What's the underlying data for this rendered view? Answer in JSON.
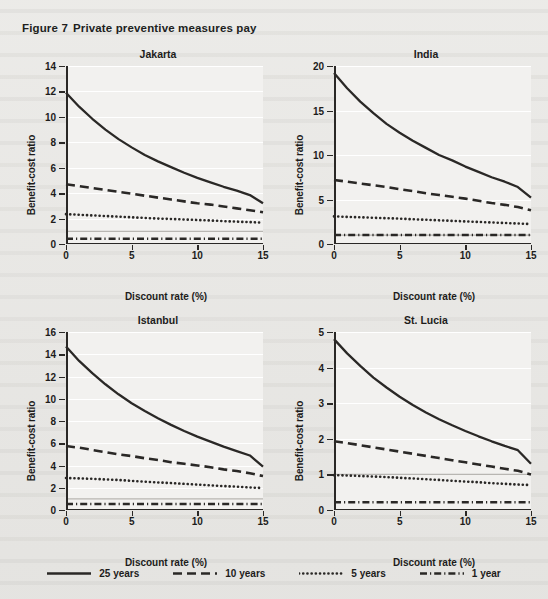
{
  "figure": {
    "number": "Figure 7",
    "title": "Private preventive measures pay"
  },
  "colors": {
    "line": "#2a2826",
    "reference_line": "#b8b6b2",
    "plot_background": "#f2f1ef",
    "page_background": "#e8e7e4",
    "gridline": "#ffffff",
    "text": "#1d1c1b"
  },
  "legend": {
    "position": "bottom-center",
    "items": [
      {
        "label": "25 years",
        "style": "solid",
        "name": "legend-25-years"
      },
      {
        "label": "10 years",
        "style": "dashed",
        "name": "legend-10-years"
      },
      {
        "label": "5 years",
        "style": "dotted",
        "name": "legend-5-years"
      },
      {
        "label": "1 year",
        "style": "dashdotted",
        "name": "legend-1-year"
      }
    ]
  },
  "chart_data": [
    {
      "type": "line",
      "title": "Jakarta",
      "xlabel": "Discount rate (%)",
      "ylabel": "Benefit-cost ratio",
      "xlim": [
        0,
        15
      ],
      "ylim": [
        0,
        14
      ],
      "xticks": [
        0,
        5,
        10,
        15
      ],
      "yticks": [
        0,
        2,
        4,
        6,
        8,
        10,
        12,
        14
      ],
      "grid": true,
      "reference_line_y": 1,
      "x": [
        0,
        1,
        2,
        3,
        4,
        5,
        6,
        7,
        8,
        9,
        10,
        11,
        12,
        13,
        14,
        15
      ],
      "series": [
        {
          "name": "25 years",
          "style": "solid",
          "values": [
            11.9,
            10.8,
            9.85,
            9.0,
            8.25,
            7.6,
            7.0,
            6.5,
            6.05,
            5.6,
            5.2,
            4.85,
            4.5,
            4.2,
            3.85,
            3.2
          ]
        },
        {
          "name": "10 years",
          "style": "dashed",
          "values": [
            4.7,
            4.55,
            4.4,
            4.25,
            4.1,
            3.95,
            3.8,
            3.65,
            3.5,
            3.35,
            3.2,
            3.1,
            2.95,
            2.8,
            2.65,
            2.5
          ]
        },
        {
          "name": "5 years",
          "style": "dotted",
          "values": [
            2.35,
            2.3,
            2.25,
            2.2,
            2.15,
            2.1,
            2.05,
            2.0,
            1.97,
            1.93,
            1.89,
            1.85,
            1.8,
            1.76,
            1.72,
            1.68
          ]
        },
        {
          "name": "1 year",
          "style": "dashdotted",
          "values": [
            0.42,
            0.42,
            0.42,
            0.42,
            0.42,
            0.42,
            0.42,
            0.42,
            0.42,
            0.42,
            0.42,
            0.42,
            0.42,
            0.42,
            0.42,
            0.42
          ]
        }
      ]
    },
    {
      "type": "line",
      "title": "India",
      "xlabel": "Discount rate (%)",
      "ylabel": "Benefit-cost ratio",
      "xlim": [
        0,
        15
      ],
      "ylim": [
        0,
        20
      ],
      "xticks": [
        0,
        5,
        10,
        15
      ],
      "yticks": [
        0,
        5,
        10,
        15,
        20
      ],
      "grid": true,
      "reference_line_y": 1,
      "x": [
        0,
        1,
        2,
        3,
        4,
        5,
        6,
        7,
        8,
        9,
        10,
        11,
        12,
        13,
        14,
        15
      ],
      "series": [
        {
          "name": "25 years",
          "style": "solid",
          "values": [
            19.2,
            17.5,
            16.0,
            14.7,
            13.5,
            12.5,
            11.6,
            10.8,
            10.0,
            9.4,
            8.7,
            8.1,
            7.5,
            7.0,
            6.4,
            5.2
          ]
        },
        {
          "name": "10 years",
          "style": "dashed",
          "values": [
            7.2,
            7.0,
            6.8,
            6.6,
            6.4,
            6.15,
            5.95,
            5.7,
            5.5,
            5.3,
            5.1,
            4.85,
            4.6,
            4.4,
            4.15,
            3.8
          ]
        },
        {
          "name": "5 years",
          "style": "dotted",
          "values": [
            3.1,
            3.05,
            3.0,
            2.95,
            2.9,
            2.85,
            2.78,
            2.72,
            2.66,
            2.6,
            2.54,
            2.48,
            2.42,
            2.36,
            2.3,
            2.25
          ]
        },
        {
          "name": "1 year",
          "style": "dashdotted",
          "values": [
            1.0,
            1.0,
            1.0,
            1.0,
            1.0,
            1.0,
            1.0,
            1.0,
            1.0,
            1.0,
            1.0,
            1.0,
            1.0,
            1.0,
            1.0,
            1.0
          ]
        }
      ]
    },
    {
      "type": "line",
      "title": "Istanbul",
      "xlabel": "Discount rate (%)",
      "ylabel": "Benefit-cost ratio",
      "xlim": [
        0,
        15
      ],
      "ylim": [
        0,
        16
      ],
      "xticks": [
        0,
        5,
        10,
        15
      ],
      "yticks": [
        0,
        2,
        4,
        6,
        8,
        10,
        12,
        14,
        16
      ],
      "grid": true,
      "reference_line_y": 1,
      "x": [
        0,
        1,
        2,
        3,
        4,
        5,
        6,
        7,
        8,
        9,
        10,
        11,
        12,
        13,
        14,
        15
      ],
      "series": [
        {
          "name": "25 years",
          "style": "solid",
          "values": [
            14.7,
            13.4,
            12.3,
            11.3,
            10.4,
            9.6,
            8.9,
            8.25,
            7.65,
            7.1,
            6.6,
            6.15,
            5.7,
            5.3,
            4.9,
            3.9
          ]
        },
        {
          "name": "10 years",
          "style": "dashed",
          "values": [
            5.75,
            5.6,
            5.4,
            5.2,
            5.0,
            4.85,
            4.65,
            4.5,
            4.3,
            4.15,
            4.0,
            3.85,
            3.65,
            3.5,
            3.3,
            3.05
          ]
        },
        {
          "name": "5 years",
          "style": "dotted",
          "values": [
            2.88,
            2.84,
            2.8,
            2.75,
            2.7,
            2.62,
            2.55,
            2.48,
            2.42,
            2.35,
            2.28,
            2.22,
            2.15,
            2.1,
            2.02,
            1.98
          ]
        },
        {
          "name": "1 year",
          "style": "dashdotted",
          "values": [
            0.55,
            0.55,
            0.55,
            0.55,
            0.55,
            0.55,
            0.55,
            0.55,
            0.55,
            0.55,
            0.55,
            0.55,
            0.55,
            0.55,
            0.55,
            0.55
          ]
        }
      ]
    },
    {
      "type": "line",
      "title": "St. Lucia",
      "xlabel": "Discount rate (%)",
      "ylabel": "Benefit-cost ratio",
      "xlim": [
        0,
        15
      ],
      "ylim": [
        0,
        5
      ],
      "xticks": [
        0,
        5,
        10,
        15
      ],
      "yticks": [
        0,
        1,
        2,
        3,
        4,
        5
      ],
      "grid": true,
      "reference_line_y": 1,
      "x": [
        0,
        1,
        2,
        3,
        4,
        5,
        6,
        7,
        8,
        9,
        10,
        11,
        12,
        13,
        14,
        15
      ],
      "series": [
        {
          "name": "25 years",
          "style": "solid",
          "values": [
            4.8,
            4.4,
            4.05,
            3.72,
            3.44,
            3.18,
            2.95,
            2.74,
            2.55,
            2.38,
            2.22,
            2.07,
            1.93,
            1.8,
            1.68,
            1.3
          ]
        },
        {
          "name": "10 years",
          "style": "dashed",
          "values": [
            1.93,
            1.88,
            1.82,
            1.76,
            1.7,
            1.64,
            1.58,
            1.52,
            1.46,
            1.4,
            1.34,
            1.28,
            1.22,
            1.16,
            1.1,
            1.0
          ]
        },
        {
          "name": "5 years",
          "style": "dotted",
          "values": [
            0.98,
            0.97,
            0.955,
            0.94,
            0.925,
            0.905,
            0.885,
            0.865,
            0.845,
            0.82,
            0.8,
            0.78,
            0.755,
            0.735,
            0.715,
            0.7
          ]
        },
        {
          "name": "1 year",
          "style": "dashdotted",
          "values": [
            0.22,
            0.22,
            0.22,
            0.22,
            0.22,
            0.22,
            0.22,
            0.22,
            0.22,
            0.22,
            0.22,
            0.22,
            0.22,
            0.22,
            0.22,
            0.22
          ]
        }
      ]
    }
  ]
}
